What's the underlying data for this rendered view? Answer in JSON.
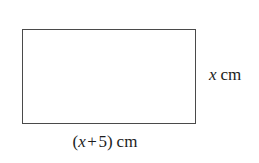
{
  "figure": {
    "type": "geometry-diagram",
    "shape": "rectangle",
    "background_color": "#ffffff",
    "stroke_color": "#4a4a4a",
    "fill_color": "#ffffff",
    "text_color": "#1c1c1c"
  },
  "labels": {
    "height": {
      "variable": "x",
      "unit": "cm",
      "full_text": "x cm",
      "position": "right"
    },
    "width": {
      "open_paren": "(",
      "variable": "x",
      "operator": "+",
      "constant": "5",
      "close_paren": ")",
      "unit": "cm",
      "full_text": "(x + 5) cm",
      "position": "bottom"
    }
  }
}
